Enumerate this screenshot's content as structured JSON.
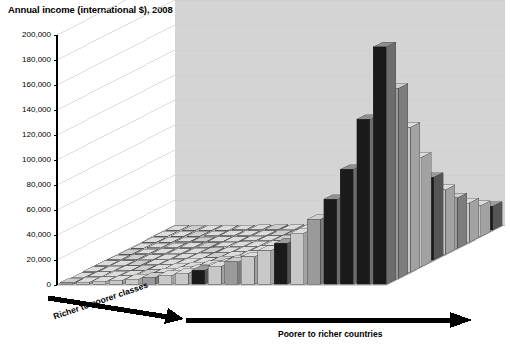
{
  "chart_data": {
    "type": "bar",
    "title": "Annual income (international $), 2008",
    "subtitle": "",
    "xlabel": "Poorer to richer countries",
    "ylabel": "",
    "zlabel": "Richer to poorer classes",
    "ylim": [
      0,
      200000
    ],
    "yticks": [
      "0",
      "20,000",
      "40,000",
      "60,000",
      "80,000",
      "100,000",
      "120,000",
      "140,000",
      "160,000",
      "180,000",
      "200,000"
    ],
    "ytick_values": [
      0,
      20000,
      40000,
      60000,
      80000,
      100000,
      120000,
      140000,
      160000,
      180000,
      200000
    ],
    "grid": true,
    "legend_position": "none",
    "projection": "3d-surface-bars",
    "annotations": [
      "Arrow along front-left edge labelled 'Richer to poorer classes'",
      "Arrow along front-right edge labelled 'Poorer to richer countries'"
    ],
    "categories": [
      "c1",
      "c2",
      "c3",
      "c4",
      "c5",
      "c6",
      "c7",
      "c8",
      "c9",
      "c10",
      "c11",
      "c12",
      "c13",
      "c14",
      "c15",
      "c16",
      "c17",
      "c18",
      "c19",
      "c20"
    ],
    "series": [
      {
        "name": "richest class (row 1)",
        "values": [
          1200,
          1800,
          2400,
          3200,
          4200,
          5600,
          7200,
          9000,
          11500,
          14500,
          18000,
          22000,
          27000,
          33000,
          41000,
          52000,
          68000,
          92000,
          132000,
          190000
        ]
      },
      {
        "name": "class 2",
        "values": [
          900,
          1400,
          1900,
          2500,
          3300,
          4400,
          5700,
          7200,
          9200,
          11600,
          14400,
          17600,
          21600,
          26400,
          32800,
          41600,
          54400,
          73600,
          105600,
          152000
        ]
      },
      {
        "name": "class 3",
        "values": [
          700,
          1050,
          1450,
          1900,
          2500,
          3350,
          4350,
          5500,
          7000,
          8800,
          11000,
          13400,
          16500,
          20100,
          25000,
          31700,
          41400,
          56100,
          80500,
          115900
        ]
      },
      {
        "name": "class 4",
        "values": [
          540,
          800,
          1100,
          1450,
          1900,
          2550,
          3300,
          4150,
          5300,
          6700,
          8300,
          10100,
          12400,
          15200,
          18900,
          23900,
          31300,
          42300,
          60700,
          87400
        ]
      },
      {
        "name": "class 5",
        "values": [
          420,
          620,
          850,
          1120,
          1470,
          1960,
          2520,
          3150,
          4030,
          5080,
          6300,
          7700,
          9450,
          11550,
          14350,
          18200,
          23800,
          32200,
          46200,
          66500
        ]
      },
      {
        "name": "class 6",
        "values": [
          330,
          480,
          660,
          870,
          1140,
          1520,
          1960,
          2460,
          3140,
          3960,
          4900,
          5980,
          7350,
          8980,
          11160,
          14140,
          18480,
          25060,
          35980,
          51800
        ]
      },
      {
        "name": "class 7",
        "values": [
          260,
          380,
          520,
          680,
          890,
          1190,
          1530,
          1920,
          2450,
          3090,
          3830,
          4670,
          5740,
          7010,
          8710,
          11040,
          14430,
          19570,
          28080,
          40440
        ]
      },
      {
        "name": "class 8",
        "values": [
          200,
          295,
          405,
          530,
          695,
          925,
          1190,
          1495,
          1910,
          2405,
          2980,
          3640,
          4470,
          5460,
          6790,
          8600,
          11240,
          15240,
          21870,
          31490
        ]
      },
      {
        "name": "class 9",
        "values": [
          160,
          230,
          315,
          415,
          545,
          725,
          930,
          1170,
          1490,
          1880,
          2330,
          2840,
          3490,
          4260,
          5300,
          6710,
          8770,
          11890,
          17060,
          24570
        ]
      },
      {
        "name": "poorest class (row 10)",
        "values": [
          125,
          180,
          245,
          325,
          425,
          565,
          730,
          915,
          1170,
          1470,
          1820,
          2220,
          2730,
          3330,
          4140,
          5250,
          6860,
          9300,
          13340,
          19210
        ]
      }
    ],
    "peak_value": 190000,
    "peak_location": "rightmost country, richest class"
  },
  "colors": {
    "bar_light": "#c8c8c8",
    "bar_mid": "#9a9a9a",
    "bar_dark": "#1a1a1a",
    "floor": "#b6b6b6",
    "back_wall": "#d4d4d4",
    "grid": "#cfcfcf",
    "axis": "#000000",
    "text": "#000000"
  }
}
